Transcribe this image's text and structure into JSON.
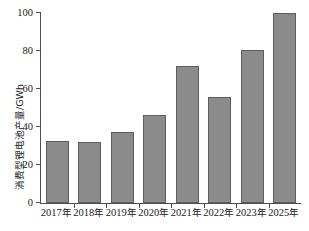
{
  "chart_data": {
    "type": "bar",
    "title": "",
    "xlabel": "",
    "ylabel": "消费型锂电池产量/GWh",
    "categories": [
      "2017年",
      "2018年",
      "2019年",
      "2020年",
      "2021年",
      "2022年",
      "2023年",
      "2025年"
    ],
    "values": [
      32.5,
      32,
      37.5,
      46.5,
      72,
      56,
      80.5,
      100
    ],
    "ylim": [
      0,
      100
    ],
    "yticks": [
      0,
      20,
      40,
      60,
      80,
      100
    ],
    "ytick_labels": [
      "0",
      "20",
      "40",
      "60",
      "80",
      "100"
    ],
    "grid": false,
    "legend": null,
    "series": [
      {
        "name": "消费型锂电池产量",
        "values": [
          32.5,
          32,
          37.5,
          46.5,
          72,
          56,
          80.5,
          100
        ],
        "color": "#8b8b8b"
      }
    ],
    "colors": {
      "bar_fill": "#8b8b8b",
      "bar_edge": "#5e5e5e",
      "axis": "#4d4d4d",
      "text": "#1a1a1a",
      "background": "#ffffff"
    }
  }
}
